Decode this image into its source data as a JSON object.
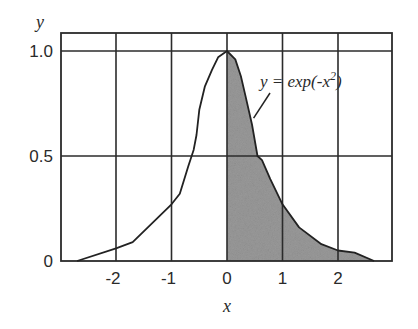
{
  "chart_data": {
    "type": "area",
    "title": "",
    "xlabel": "x",
    "ylabel": "y",
    "xlim": [
      -3,
      3
    ],
    "ylim": [
      0,
      1.1
    ],
    "x_ticks": [
      -2,
      -1,
      0,
      1,
      2
    ],
    "x_tick_labels": [
      "-2",
      "-1",
      "0",
      "1",
      "2"
    ],
    "y_ticks": [
      0,
      0.5,
      1.0
    ],
    "y_tick_labels": [
      "0",
      "0.5",
      "1.0"
    ],
    "grid": true,
    "legend": null,
    "series": [
      {
        "name": "y = exp(-x^2)",
        "x": [
          -2.7,
          -2.0,
          -1.7,
          -1.0,
          -0.85,
          -0.7,
          -0.6,
          -0.55,
          -0.5,
          -0.4,
          -0.27,
          -0.16,
          0.0,
          0.15,
          0.25,
          0.33,
          0.45,
          0.55,
          0.63,
          0.78,
          1.0,
          1.3,
          1.7,
          2.0,
          2.3,
          2.65
        ],
        "y": [
          0.0,
          0.06,
          0.09,
          0.27,
          0.32,
          0.45,
          0.53,
          0.6,
          0.72,
          0.83,
          0.91,
          0.97,
          1.0,
          0.96,
          0.88,
          0.79,
          0.65,
          0.5,
          0.48,
          0.39,
          0.27,
          0.16,
          0.08,
          0.05,
          0.04,
          0.0
        ]
      }
    ],
    "shaded_region": {
      "from_x": 0,
      "to_x": 2.65,
      "under": "y = exp(-x^2)",
      "color": "#9a9a9a"
    },
    "annotations": [
      {
        "text": "y = exp(-x",
        "superscript": "2",
        "suffix": ")",
        "x": 0.6,
        "y": 0.82,
        "leader_to": [
          0.48,
          0.68
        ]
      }
    ]
  },
  "labels": {
    "y_axis": "y",
    "x_axis": "x",
    "annotation_main": "y = exp(-x",
    "annotation_sup": "2",
    "annotation_close": ")"
  },
  "colors": {
    "background": "#ffffff",
    "line": "#222222",
    "shade": "#9a9a9a"
  }
}
